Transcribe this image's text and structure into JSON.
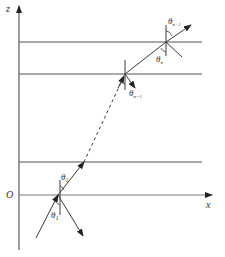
{
  "diagram": {
    "title": "",
    "axes": {
      "z_label": "z",
      "x_label": "x",
      "origin_label": "O"
    },
    "angles": {
      "theta_1_upper": {
        "symbol": "θ",
        "sub": "1"
      },
      "theta_1_lower": {
        "symbol": "θ",
        "sub": "1"
      },
      "theta_n_minus_1": {
        "symbol": "θ",
        "sub": "n−1"
      },
      "theta_n": {
        "symbol": "θ",
        "sub": "n"
      },
      "theta_n_plus_1": {
        "symbol": "θ",
        "sub": "n+1"
      }
    },
    "colors": {
      "line": "#3a3a3a",
      "background": "#ffffff"
    },
    "layers": 4
  }
}
